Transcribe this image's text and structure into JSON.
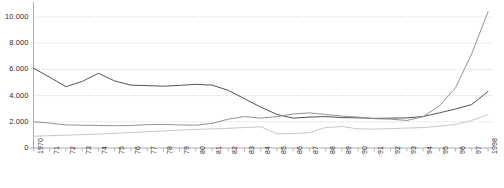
{
  "chart_data": {
    "type": "line",
    "title": "",
    "subtitle": "",
    "xlabel": "",
    "ylabel": "",
    "grid": true,
    "legend": "none",
    "xlim": [
      1970,
      1998
    ],
    "ylim": [
      0,
      11000
    ],
    "yticks": [
      0,
      2000,
      4000,
      6000,
      8000,
      10000
    ],
    "ytick_labels": [
      "0",
      "2.000",
      "4.000",
      "6.000",
      "8.000",
      "10.000"
    ],
    "x": [
      1970,
      1971,
      1972,
      1973,
      1974,
      1975,
      1976,
      1977,
      1978,
      1979,
      1980,
      1981,
      1982,
      1983,
      1984,
      1985,
      1986,
      1987,
      1988,
      1989,
      1990,
      1991,
      1992,
      1993,
      1994,
      1995,
      1996,
      1997,
      1998
    ],
    "xtick_labels": [
      "1970",
      "71",
      "72",
      "73",
      "74",
      "75",
      "76",
      "77",
      "78",
      "79",
      "80",
      "81",
      "82",
      "83",
      "84",
      "85",
      "86",
      "87",
      "88",
      "89",
      "90",
      "91",
      "92",
      "93",
      "94",
      "95",
      "96",
      "97",
      "1998"
    ],
    "series": [
      {
        "name": "series-dark",
        "color": "#4a4a4a",
        "values": [
          6100,
          5400,
          4680,
          5080,
          5700,
          5120,
          4800,
          4760,
          4720,
          4780,
          4860,
          4800,
          4400,
          3760,
          3120,
          2560,
          2280,
          2360,
          2400,
          2320,
          2300,
          2260,
          2280,
          2300,
          2400,
          2680,
          2980,
          3320,
          4320
        ]
      },
      {
        "name": "series-medium",
        "color": "#8c8c8c",
        "values": [
          2000,
          1900,
          1760,
          1740,
          1720,
          1700,
          1720,
          1780,
          1800,
          1760,
          1740,
          1880,
          2200,
          2400,
          2280,
          2400,
          2600,
          2680,
          2560,
          2440,
          2360,
          2240,
          2200,
          2100,
          2400,
          3200,
          4600,
          7200,
          10400
        ]
      },
      {
        "name": "series-light",
        "color": "#c4c4c4",
        "values": [
          900,
          940,
          980,
          1020,
          1060,
          1120,
          1180,
          1240,
          1300,
          1360,
          1420,
          1460,
          1500,
          1560,
          1620,
          1080,
          1100,
          1180,
          1560,
          1640,
          1460,
          1440,
          1480,
          1520,
          1560,
          1660,
          1800,
          2100,
          2560
        ]
      }
    ]
  }
}
